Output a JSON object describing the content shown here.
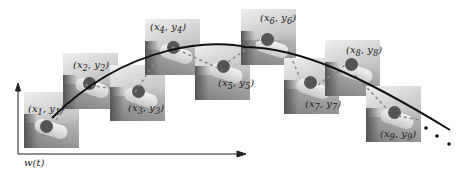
{
  "figure": {
    "axis_label": "w(t)",
    "patches": [
      {
        "id": 1,
        "label": "(x1, y1)",
        "x": 24,
        "y": 92
      },
      {
        "id": 2,
        "label": "(x2, y2)",
        "x": 63,
        "y": 53
      },
      {
        "id": 3,
        "label": "(x3, y3)",
        "x": 110,
        "y": 65
      },
      {
        "id": 4,
        "label": "(x4, y4)",
        "x": 145,
        "y": 19
      },
      {
        "id": 5,
        "label": "(x5, y5)",
        "x": 195,
        "y": 44
      },
      {
        "id": 6,
        "label": "(x6, y6)",
        "x": 241,
        "y": 9
      },
      {
        "id": 7,
        "label": "(x7, y7)",
        "x": 284,
        "y": 58
      },
      {
        "id": 8,
        "label": "(x8, y8)",
        "x": 325,
        "y": 40
      },
      {
        "id": 9,
        "label": "(x9, y9)",
        "x": 366,
        "y": 86
      }
    ],
    "colors": {
      "curve": "#111111",
      "axis": "#222222",
      "dashed": "#888888"
    }
  }
}
